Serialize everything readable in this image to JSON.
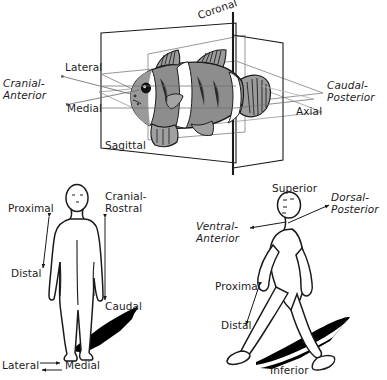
{
  "figure": {
    "background_color": "#ffffff",
    "ink_color": "#1a1a1a",
    "fish_body_color": "#8f8f8f",
    "fish_stripe_color": "#ffffff",
    "shadow_color": "#000000"
  },
  "panels": {
    "top": {
      "name": "fish-planes-panel",
      "subject": "clownfish",
      "planes": [
        {
          "id": "coronal",
          "label": "Coronal",
          "style": "regular",
          "rotated": true
        },
        {
          "id": "sagittal",
          "label": "Sagittal",
          "style": "regular",
          "rotated": false
        },
        {
          "id": "axial",
          "label": "Axial",
          "style": "regular",
          "rotated": false
        }
      ],
      "directions": [
        {
          "id": "cranial-anterior",
          "label": "Cranial-\nAnterior",
          "style": "italic"
        },
        {
          "id": "caudal-posterior",
          "label": "Caudal-\nPosterior",
          "style": "italic"
        },
        {
          "id": "lateral",
          "label": "Lateral",
          "style": "regular"
        },
        {
          "id": "medial",
          "label": "Medial",
          "style": "regular"
        }
      ]
    },
    "bottom_left": {
      "name": "standing-human-panel",
      "subject": "standing human figure, frontal view",
      "labels": [
        {
          "id": "proximal",
          "label": "Proximal",
          "style": "regular"
        },
        {
          "id": "distal",
          "label": "Distal",
          "style": "regular"
        },
        {
          "id": "cranial-rostral",
          "label": "Cranial-\nRostral",
          "style": "regular"
        },
        {
          "id": "caudal",
          "label": "Caudal",
          "style": "regular"
        },
        {
          "id": "lateral",
          "label": "Lateral",
          "style": "regular"
        },
        {
          "id": "medial",
          "label": "Medial",
          "style": "regular"
        }
      ]
    },
    "bottom_right": {
      "name": "walking-human-panel",
      "subject": "walking human figure, lateral view",
      "labels": [
        {
          "id": "superior",
          "label": "Superior",
          "style": "regular"
        },
        {
          "id": "inferior",
          "label": "Inferior",
          "style": "regular"
        },
        {
          "id": "dorsal-posterior",
          "label": "Dorsal-\nPosterior",
          "style": "italic"
        },
        {
          "id": "ventral-anterior",
          "label": "Ventral-\nAnterior",
          "style": "italic"
        },
        {
          "id": "proximal",
          "label": "Proximal",
          "style": "regular"
        },
        {
          "id": "distal",
          "label": "Distal",
          "style": "regular"
        }
      ]
    }
  }
}
